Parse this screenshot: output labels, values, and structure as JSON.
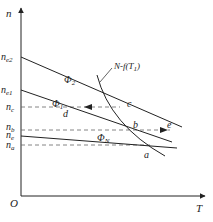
{
  "axes": {
    "y_label": "n",
    "x_label": "T",
    "origin_label": "O"
  },
  "y_levels": [
    {
      "label": "n",
      "sub": "e2",
      "y": 57
    },
    {
      "label": "n",
      "sub": "e1",
      "y": 90
    },
    {
      "label": "n",
      "sub": "c",
      "y": 107
    },
    {
      "label": "n",
      "sub": "b",
      "y": 130
    },
    {
      "label": "n",
      "sub": "e",
      "y": 136
    },
    {
      "label": "n",
      "sub": "a",
      "y": 145
    }
  ],
  "curves": {
    "phi2": {
      "label": "Φ",
      "sub": "2"
    },
    "phi1": {
      "label": "Φ",
      "sub": "1"
    },
    "phiN": {
      "label": "Φ",
      "sub": "N"
    },
    "load": {
      "label": "N-f(T",
      "sub": "1",
      "suffix": ")"
    }
  },
  "points": {
    "a": "a",
    "b": "b",
    "c": "c",
    "d": "d",
    "e": "e"
  },
  "colors": {
    "line": "#222222",
    "dashed": "#666666"
  }
}
